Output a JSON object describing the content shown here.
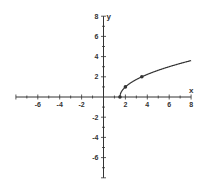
{
  "chart_data": {
    "type": "line",
    "title": "",
    "function": "y = sqrt(2x - 3)",
    "xlabel": "x",
    "ylabel": "y",
    "xlim": [
      -8,
      8
    ],
    "ylim": [
      -8,
      8
    ],
    "grid": false,
    "x_tick_labels": [
      "-6",
      "-4",
      "-2",
      "2",
      "4",
      "6",
      "8"
    ],
    "y_tick_labels": [
      "8",
      "6",
      "4",
      "2",
      "-2",
      "-4",
      "-6"
    ],
    "marked_points": [
      {
        "x": 1.5,
        "y": 0
      },
      {
        "x": 2,
        "y": 1
      },
      {
        "x": 3.5,
        "y": 2
      }
    ],
    "series": [
      {
        "name": "curve",
        "x": [
          1.5,
          1.6,
          1.75,
          2,
          2.5,
          3,
          3.5,
          4,
          5,
          6,
          7,
          8
        ],
        "y": [
          0,
          0.447,
          0.707,
          1,
          1.414,
          1.732,
          2,
          2.236,
          2.646,
          3,
          3.317,
          3.606
        ]
      }
    ]
  },
  "colors": {
    "axis": "#333333",
    "curve": "#333333",
    "background": "#ffffff"
  }
}
